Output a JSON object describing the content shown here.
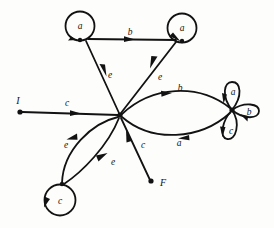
{
  "figure": {
    "kind": "state-transition-diagram",
    "background_color": "#fdfdfc",
    "ink_color": "#121212",
    "width": 274,
    "height": 228
  },
  "terminals": {
    "initial": {
      "label": "I",
      "x": 18,
      "y": 112
    },
    "final": {
      "label": "F",
      "x": 153,
      "y": 183
    }
  },
  "nodes": [
    {
      "id": "hub",
      "type": "junction",
      "x": 120,
      "y": 115,
      "label": ""
    },
    {
      "id": "top_left",
      "type": "self-loop-circle",
      "x": 80,
      "y": 26,
      "label": "a"
    },
    {
      "id": "top_right",
      "type": "self-loop-circle",
      "x": 182,
      "y": 28,
      "label": "a"
    },
    {
      "id": "bottom_left",
      "type": "self-loop-circle",
      "x": 60,
      "y": 200,
      "label": "c"
    },
    {
      "id": "right_hub",
      "type": "triple-petal-junction",
      "x": 232,
      "y": 110,
      "label": ""
    }
  ],
  "petal_labels": {
    "top": "a",
    "right": "b",
    "bottom": "c"
  },
  "edges": [
    {
      "id": "e_initial",
      "label": "c",
      "from": "I",
      "to": "hub",
      "label_x": 67,
      "label_y": 106
    },
    {
      "id": "e_topleft_in",
      "label": "e",
      "from": "top_left",
      "to": "hub",
      "label_x": 110,
      "label_y": 78
    },
    {
      "id": "e_topright_out",
      "label": "e",
      "from": "hub",
      "to": "top_right",
      "label_x": 160,
      "label_y": 80
    },
    {
      "id": "e_top_b",
      "label": "b",
      "from": "top_left",
      "to": "top_right",
      "label_x": 130,
      "label_y": 35
    },
    {
      "id": "e_right_b",
      "label": "b",
      "from": "hub",
      "to": "right_hub",
      "label_x": 180,
      "label_y": 91
    },
    {
      "id": "e_right_a",
      "label": "a",
      "from": "right_hub",
      "to": "hub",
      "label_x": 179,
      "label_y": 146
    },
    {
      "id": "e_bl_out",
      "label": "e",
      "from": "hub",
      "to": "bottom_left",
      "label_x": 66,
      "label_y": 148
    },
    {
      "id": "e_bl_in",
      "label": "e",
      "from": "bottom_left",
      "to": "hub",
      "label_x": 113,
      "label_y": 165
    },
    {
      "id": "e_final",
      "label": "c",
      "from": "F",
      "to": "hub",
      "label_x": 143,
      "label_y": 148
    }
  ],
  "alphabet": [
    "a",
    "b",
    "c",
    "e"
  ]
}
